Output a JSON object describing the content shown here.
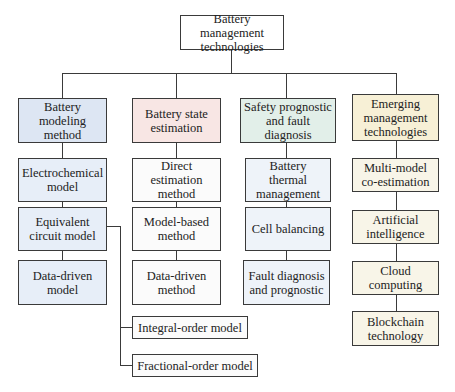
{
  "diagram": {
    "type": "hierarchy-tree",
    "root": {
      "label": "Battery management technologies"
    },
    "categories": [
      {
        "label": "Battery modeling method",
        "color": "#dde6f3",
        "children": [
          {
            "label": "Electrochemical model"
          },
          {
            "label": "Equivalent circuit model",
            "children": [
              {
                "label": "Integral-order model"
              },
              {
                "label": "Fractional-order model"
              }
            ]
          },
          {
            "label": "Data-driven model"
          }
        ]
      },
      {
        "label": "Battery state estimation",
        "color": "#f8e6e4",
        "children": [
          {
            "label": "Direct estimation method"
          },
          {
            "label": "Model-based method"
          },
          {
            "label": "Data-driven method"
          }
        ]
      },
      {
        "label": "Safety prognostic and fault diagnosis",
        "color": "#e2efe9",
        "children": [
          {
            "label": "Battery thermal management"
          },
          {
            "label": "Cell balancing"
          },
          {
            "label": "Fault diagnosis and prognostic"
          }
        ]
      },
      {
        "label": "Emerging management technologies",
        "color": "#f7f0d6",
        "children": [
          {
            "label": "Multi-model co-estimation"
          },
          {
            "label": "Artificial intelligence"
          },
          {
            "label": "Cloud computing"
          },
          {
            "label": "Blockchain technology"
          }
        ]
      }
    ]
  }
}
